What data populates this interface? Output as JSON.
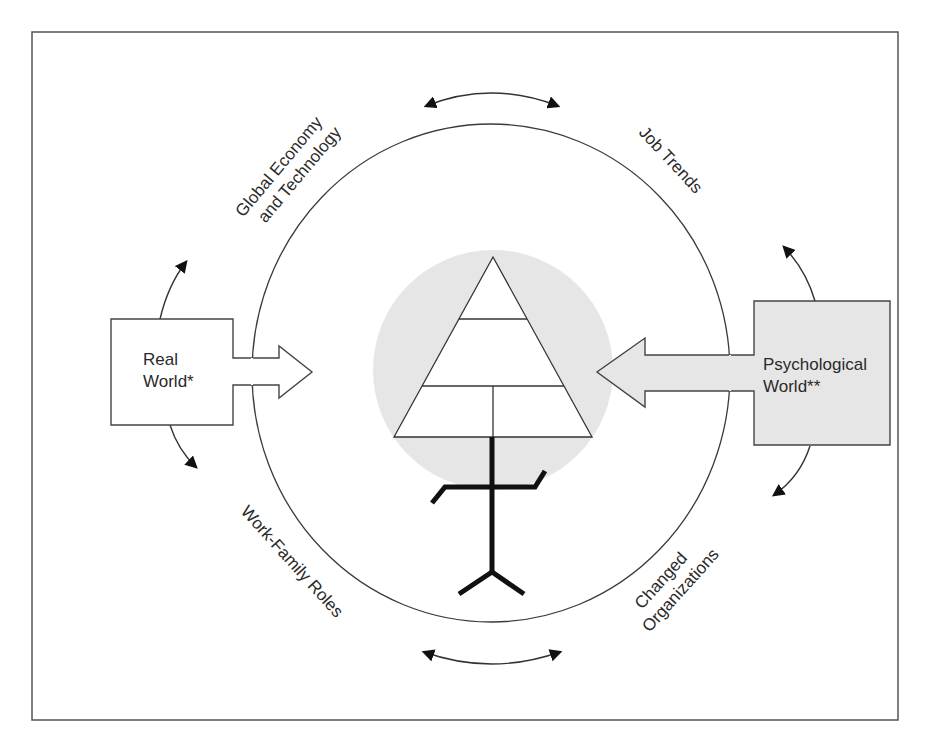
{
  "diagram": {
    "type": "conceptual-model",
    "colors": {
      "stroke": "#3a3a3a",
      "figure": "#111111",
      "shade": "#e6e6e6",
      "background": "#ffffff"
    },
    "ring_labels": {
      "top_left": [
        "Global Economy",
        "and Technology"
      ],
      "top_right": [
        "Job Trends"
      ],
      "bottom_left": [
        "Work-Family Roles"
      ],
      "bottom_right": [
        "Changed",
        "Organizations"
      ]
    },
    "left_box": {
      "lines": [
        "Real",
        "World*"
      ]
    },
    "right_box": {
      "lines": [
        "Psychological",
        "World**"
      ]
    },
    "center": {
      "pyramid_tiers": 3,
      "figure": "stick-figure"
    }
  }
}
